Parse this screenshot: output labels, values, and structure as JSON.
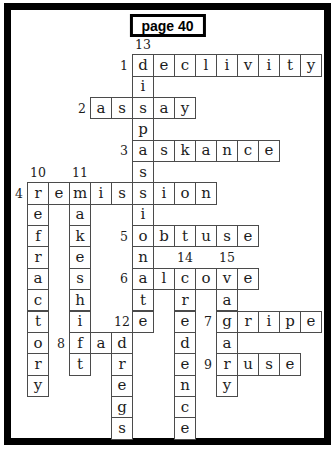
{
  "page": {
    "title": "page 40"
  },
  "colors": {
    "frame": "#000000",
    "cell_border": "#4b4b4b",
    "letter": "#1c1c1c",
    "background": "#ffffff"
  },
  "puzzle": {
    "grid": {
      "origin_x": 27,
      "origin_y": 54.3,
      "col_step": 21,
      "row_step": 21.35
    },
    "words": [
      {
        "num": 1,
        "dir": "across",
        "row": 1,
        "col": 6,
        "answer": "declivity"
      },
      {
        "num": 2,
        "dir": "across",
        "row": 3,
        "col": 4,
        "answer": "assay"
      },
      {
        "num": 3,
        "dir": "across",
        "row": 5,
        "col": 6,
        "answer": "askance"
      },
      {
        "num": 4,
        "dir": "across",
        "row": 7,
        "col": 1,
        "answer": "remission"
      },
      {
        "num": 5,
        "dir": "across",
        "row": 9,
        "col": 6,
        "answer": "obtuse"
      },
      {
        "num": 6,
        "dir": "across",
        "row": 11,
        "col": 6,
        "answer": "alcove"
      },
      {
        "num": 7,
        "dir": "across",
        "row": 13,
        "col": 10,
        "answer": "gripe"
      },
      {
        "num": 8,
        "dir": "across",
        "row": 14,
        "col": 3,
        "answer": "fad"
      },
      {
        "num": 9,
        "dir": "across",
        "row": 15,
        "col": 10,
        "answer": "ruse"
      },
      {
        "num": 10,
        "dir": "down",
        "row": 7,
        "col": 1,
        "answer": "refractory"
      },
      {
        "num": 11,
        "dir": "down",
        "row": 7,
        "col": 3,
        "answer": "makeshift"
      },
      {
        "num": 12,
        "dir": "down",
        "row": 14,
        "col": 5,
        "answer": "dregs"
      },
      {
        "num": 13,
        "dir": "down",
        "row": 1,
        "col": 6,
        "answer": "dispassionate"
      },
      {
        "num": 14,
        "dir": "down",
        "row": 11,
        "col": 8,
        "answer": "credence"
      },
      {
        "num": 15,
        "dir": "down",
        "row": 11,
        "col": 10,
        "answer": "vagary"
      }
    ]
  }
}
